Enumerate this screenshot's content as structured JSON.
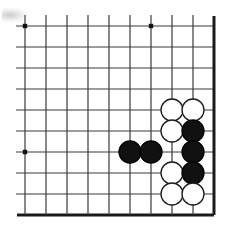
{
  "board": {
    "title": "Go board position",
    "game": "Go (Weiqi / Baduk)",
    "view": "bottom-right corner region",
    "grid": {
      "columns_visible": 10,
      "rows_visible": 10,
      "spacing_px": 21,
      "origin_x_px": 25,
      "origin_y_px": 26,
      "line_color": "#3a3a3a",
      "edge_color": "#1a1a1a",
      "thin_line_width_px": 1.2,
      "edge_line_width_px": 3,
      "background_color": "#ffffff"
    },
    "star_points": [
      {
        "col": 0,
        "row": 0
      },
      {
        "col": 6,
        "row": 0
      },
      {
        "col": 0,
        "row": 6
      }
    ],
    "edges": {
      "right": {
        "col": 9,
        "thick": true
      },
      "bottom": {
        "row": 9,
        "thick": true
      }
    },
    "stone_style": {
      "radius_px": 11,
      "black_fill": "#111111",
      "black_stroke": "#000000",
      "white_fill": "#ffffff",
      "white_stroke": "#1a1a1a",
      "stroke_width_px": 1.3
    },
    "stones": [
      {
        "color": "white",
        "col": 7,
        "row": 4
      },
      {
        "color": "white",
        "col": 8,
        "row": 4
      },
      {
        "color": "white",
        "col": 7,
        "row": 5
      },
      {
        "color": "black",
        "col": 8,
        "row": 5
      },
      {
        "color": "black",
        "col": 5,
        "row": 6
      },
      {
        "color": "black",
        "col": 6,
        "row": 6
      },
      {
        "color": "black",
        "col": 8,
        "row": 6
      },
      {
        "color": "white",
        "col": 7,
        "row": 7
      },
      {
        "color": "black",
        "col": 8,
        "row": 7
      },
      {
        "color": "white",
        "col": 7,
        "row": 8
      },
      {
        "color": "white",
        "col": 8,
        "row": 8
      }
    ],
    "counts": {
      "black_stones": 5,
      "white_stones": 6,
      "total_stones": 11
    },
    "artifact": {
      "name": "scan-smudge",
      "location": "top-left"
    }
  }
}
